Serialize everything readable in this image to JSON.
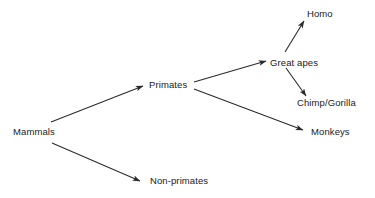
{
  "diagram": {
    "type": "tree",
    "title": "",
    "background_color": "#ffffff",
    "line_color": "#2b2b2b",
    "text_color": "#1a1a1a",
    "nodes": [
      {
        "id": "mammals",
        "label": "Mammals",
        "x": 13,
        "y": 126
      },
      {
        "id": "primates",
        "label": "Primates",
        "x": 149,
        "y": 79
      },
      {
        "id": "non_primates",
        "label": "Non-primates",
        "x": 150,
        "y": 175
      },
      {
        "id": "great_apes",
        "label": "Great apes",
        "x": 270,
        "y": 57
      },
      {
        "id": "homo",
        "label": "Homo",
        "x": 307,
        "y": 8
      },
      {
        "id": "chimp_gorilla",
        "label": "Chimp/Gorilla",
        "x": 297,
        "y": 97
      },
      {
        "id": "monkeys",
        "label": "Monkeys",
        "x": 311,
        "y": 126
      }
    ],
    "edges": [
      {
        "id": "mammals-to-primates",
        "from": "mammals",
        "to": "primates",
        "x1": 51,
        "y1": 122,
        "x2": 143,
        "y2": 86
      },
      {
        "id": "mammals-to-non-primates",
        "from": "mammals",
        "to": "non_primates",
        "x1": 52,
        "y1": 143,
        "x2": 140,
        "y2": 181
      },
      {
        "id": "primates-to-great-apes",
        "from": "primates",
        "to": "great_apes",
        "x1": 194,
        "y1": 82,
        "x2": 266,
        "y2": 61
      },
      {
        "id": "primates-to-monkeys",
        "from": "primates",
        "to": "monkeys",
        "x1": 194,
        "y1": 89,
        "x2": 303,
        "y2": 130
      },
      {
        "id": "great-apes-to-homo",
        "from": "great_apes",
        "to": "homo",
        "x1": 285,
        "y1": 52,
        "x2": 304,
        "y2": 21
      },
      {
        "id": "great-apes-to-chimp-gorilla",
        "from": "great_apes",
        "to": "chimp_gorilla",
        "x1": 286,
        "y1": 68,
        "x2": 306,
        "y2": 96
      }
    ]
  }
}
